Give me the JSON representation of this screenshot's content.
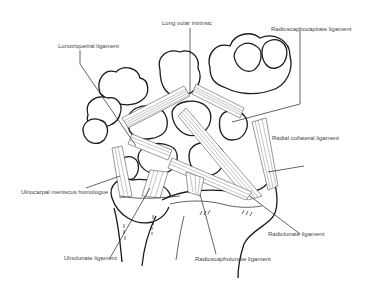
{
  "figure": {
    "labels": [
      {
        "id": "lunotriquetral",
        "text": "Lunotriquetral ligament"
      },
      {
        "id": "long-volar-intrinsic",
        "text": "Long volar intrinsic"
      },
      {
        "id": "radioscaphocapitate",
        "text": "Radioscaphocapitate ligament"
      },
      {
        "id": "radial-collateral",
        "text": "Radial collateral ligament"
      },
      {
        "id": "ulnocarpal-meniscus",
        "text": "Ulnocarpal meniscus homologue"
      },
      {
        "id": "radiolunate",
        "text": "Radiolunate ligament"
      },
      {
        "id": "ulnolunate",
        "text": "Ulnolunate ligament"
      },
      {
        "id": "radioscapholunate",
        "text": "Radioscapholunate ligament"
      }
    ]
  }
}
